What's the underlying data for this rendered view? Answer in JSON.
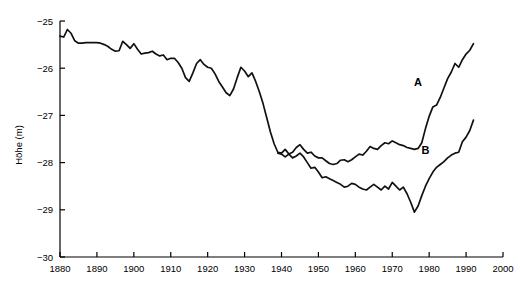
{
  "chart_data": {
    "type": "line",
    "title": "",
    "xlabel": "",
    "ylabel": "Höhe (m)",
    "xlim": [
      1880,
      2000
    ],
    "ylim": [
      -30,
      -25
    ],
    "xticks": [
      1880,
      1890,
      1900,
      1910,
      1920,
      1930,
      1940,
      1950,
      1960,
      1970,
      1980,
      1990,
      2000
    ],
    "yticks": [
      -25,
      -26,
      -27,
      -28,
      -29,
      -30
    ],
    "xtick_labels": [
      "1880",
      "1890",
      "1900",
      "1910",
      "1920",
      "1930",
      "1940",
      "1950",
      "1960",
      "1970",
      "1980",
      "1990",
      "2000"
    ],
    "ytick_labels": [
      "−25",
      "−26",
      "−27",
      "−28",
      "−29",
      "−30"
    ],
    "grid": false,
    "legend": "inline-labels",
    "line_color": "#111111",
    "series": [
      {
        "name": "A",
        "label_position": {
          "x": 1977,
          "y": -26.38
        },
        "x": [
          1880,
          1881,
          1882,
          1883,
          1884,
          1885,
          1886,
          1887,
          1888,
          1889,
          1890,
          1891,
          1892,
          1893,
          1894,
          1895,
          1896,
          1897,
          1898,
          1899,
          1900,
          1901,
          1902,
          1903,
          1904,
          1905,
          1906,
          1907,
          1908,
          1909,
          1910,
          1911,
          1912,
          1913,
          1914,
          1915,
          1916,
          1917,
          1918,
          1919,
          1920,
          1921,
          1922,
          1923,
          1924,
          1925,
          1926,
          1927,
          1928,
          1929,
          1930,
          1931,
          1932,
          1933,
          1934,
          1935,
          1936,
          1937,
          1938,
          1939,
          1940,
          1941,
          1942,
          1943,
          1944,
          1945,
          1946,
          1947,
          1948,
          1949,
          1950,
          1951,
          1952,
          1953,
          1954,
          1955,
          1956,
          1957,
          1958,
          1959,
          1960,
          1961,
          1962,
          1963,
          1964,
          1965,
          1966,
          1967,
          1968,
          1969,
          1970,
          1971,
          1972,
          1973,
          1974,
          1975,
          1976,
          1977,
          1978,
          1979,
          1980,
          1981,
          1982,
          1983,
          1984,
          1985,
          1986,
          1987,
          1988,
          1989,
          1990,
          1991,
          1992
        ],
        "y": [
          -25.32,
          -25.34,
          -25.18,
          -25.26,
          -25.42,
          -25.47,
          -25.47,
          -25.46,
          -25.46,
          -25.46,
          -25.46,
          -25.47,
          -25.5,
          -25.54,
          -25.6,
          -25.64,
          -25.63,
          -25.43,
          -25.5,
          -25.58,
          -25.48,
          -25.6,
          -25.7,
          -25.68,
          -25.67,
          -25.64,
          -25.7,
          -25.74,
          -25.72,
          -25.82,
          -25.79,
          -25.79,
          -25.88,
          -26.0,
          -26.2,
          -26.28,
          -26.1,
          -25.9,
          -25.82,
          -25.92,
          -25.98,
          -26.0,
          -26.12,
          -26.28,
          -26.4,
          -26.52,
          -26.58,
          -26.44,
          -26.2,
          -25.98,
          -26.06,
          -26.18,
          -26.1,
          -26.28,
          -26.5,
          -26.75,
          -27.05,
          -27.35,
          -27.6,
          -27.78,
          -27.8,
          -27.72,
          -27.82,
          -27.78,
          -27.68,
          -27.62,
          -27.72,
          -27.8,
          -27.78,
          -27.86,
          -27.9,
          -27.9,
          -27.96,
          -28.02,
          -28.04,
          -28.02,
          -27.95,
          -27.94,
          -27.98,
          -27.94,
          -27.88,
          -27.82,
          -27.84,
          -27.76,
          -27.66,
          -27.7,
          -27.72,
          -27.64,
          -27.58,
          -27.6,
          -27.54,
          -27.58,
          -27.62,
          -27.64,
          -27.68,
          -27.7,
          -27.72,
          -27.7,
          -27.58,
          -27.28,
          -27.02,
          -26.82,
          -26.78,
          -26.62,
          -26.42,
          -26.22,
          -26.08,
          -25.9,
          -25.98,
          -25.82,
          -25.7,
          -25.62,
          -25.48
        ]
      },
      {
        "name": "B",
        "label_position": {
          "x": 1979,
          "y": -27.82
        },
        "x": [
          1939,
          1940,
          1941,
          1942,
          1943,
          1944,
          1945,
          1946,
          1947,
          1948,
          1949,
          1950,
          1951,
          1952,
          1953,
          1954,
          1955,
          1956,
          1957,
          1958,
          1959,
          1960,
          1961,
          1962,
          1963,
          1964,
          1965,
          1966,
          1967,
          1968,
          1969,
          1970,
          1971,
          1972,
          1973,
          1974,
          1975,
          1976,
          1977,
          1978,
          1979,
          1980,
          1981,
          1982,
          1983,
          1984,
          1985,
          1986,
          1987,
          1988,
          1989,
          1990,
          1991,
          1992
        ],
        "y": [
          -27.8,
          -27.82,
          -27.88,
          -27.82,
          -27.9,
          -27.86,
          -27.8,
          -27.88,
          -28.0,
          -28.12,
          -28.1,
          -28.2,
          -28.32,
          -28.3,
          -28.34,
          -28.38,
          -28.42,
          -28.46,
          -28.52,
          -28.5,
          -28.44,
          -28.46,
          -28.52,
          -28.56,
          -28.58,
          -28.52,
          -28.46,
          -28.52,
          -28.58,
          -28.5,
          -28.56,
          -28.42,
          -28.5,
          -28.58,
          -28.52,
          -28.66,
          -28.84,
          -29.05,
          -28.92,
          -28.7,
          -28.5,
          -28.34,
          -28.2,
          -28.1,
          -28.04,
          -27.98,
          -27.9,
          -27.84,
          -27.8,
          -27.78,
          -27.56,
          -27.46,
          -27.32,
          -27.1
        ]
      }
    ]
  }
}
